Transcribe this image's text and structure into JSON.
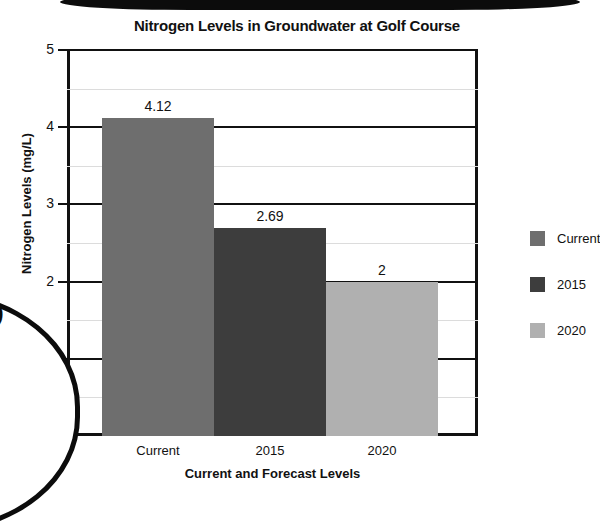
{
  "chart_data": {
    "type": "bar",
    "title": "Nitrogen Levels in Groundwater at Golf Course",
    "xlabel": "Current and Forecast Levels",
    "ylabel": "Nitrogen Levels  (mg/L)",
    "categories": [
      "Current",
      "2015",
      "2020"
    ],
    "values": [
      4.12,
      2.69,
      2
    ],
    "value_labels": [
      "4.12",
      "2.69",
      "2"
    ],
    "colors": [
      "#6e6e6e",
      "#3d3d3d",
      "#b0b0b0"
    ],
    "ylim": [
      0,
      5
    ],
    "ytick_labels": [
      "5",
      "4",
      "3",
      "2",
      "1",
      "0"
    ],
    "ytick_values": [
      5,
      4,
      3,
      2,
      1,
      0
    ],
    "minor_gridline_values": [
      4.5,
      3.5,
      2.5,
      1.5,
      0.5
    ],
    "grid": true,
    "legend_position": "right",
    "legend": [
      {
        "label": "Current",
        "color": "#6e6e6e"
      },
      {
        "label": "2015",
        "color": "#3d3d3d"
      },
      {
        "label": "2020",
        "color": "#b0b0b0"
      }
    ]
  },
  "overlay": {
    "callout_text": "| )"
  }
}
